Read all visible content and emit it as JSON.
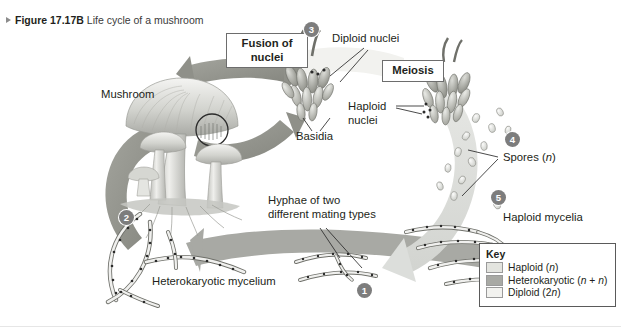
{
  "figure": {
    "marker": "▶",
    "number": "Figure 17.17B",
    "title": "Life cycle of a mushroom"
  },
  "colors": {
    "haploid": "#e3e4df",
    "heterokaryotic": "#a8a9a4",
    "diploid": "#f2f2ef",
    "arrow_dark": "#8f9089",
    "arrow_light": "#dcdedb",
    "outline": "#6d6d6d",
    "step_circle": "#7d7d7d",
    "text": "#231f20"
  },
  "labels": {
    "mushroom": "Mushroom",
    "fusion_of_nuclei": "Fusion of\nnuclei",
    "diploid_nuclei": "Diploid nuclei",
    "meiosis": "Meiosis",
    "basidia": "Basidia",
    "haploid_nuclei": "Haploid\nnuclei",
    "spores": "Spores (n)",
    "haploid_mycelia": "Haploid mycelia",
    "hyphae_mating": "Hyphae of two\ndifferent mating types",
    "heterokaryotic_mycelium": "Heterokaryotic mycelium"
  },
  "steps": [
    {
      "id": "1",
      "number": "1"
    },
    {
      "id": "2",
      "number": "2"
    },
    {
      "id": "3",
      "number": "3"
    },
    {
      "id": "4",
      "number": "4"
    },
    {
      "id": "5",
      "number": "5"
    }
  ],
  "key": {
    "title": "Key",
    "items": [
      {
        "label": "Haploid (n)",
        "color": "#e3e4df"
      },
      {
        "label": "Heterokaryotic (n + n)",
        "color": "#a8a9a4"
      },
      {
        "label": "Diploid (2n)",
        "color": "#f2f2ef"
      }
    ]
  }
}
